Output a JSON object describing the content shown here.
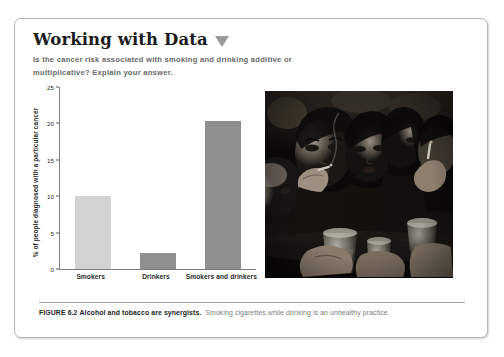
{
  "box": {
    "border_color": "#b6b6b6"
  },
  "header": {
    "title": "Working with Data",
    "triangle_icon": "triangle-down-icon",
    "triangle_color": "#9a9a9a",
    "question": "Is the cancer risk associated with smoking and drinking additive or multiplicative? Explain your answer."
  },
  "chart_data": {
    "type": "bar",
    "title": "",
    "xlabel": "",
    "ylabel": "% of people diagnosed with a particular cancer",
    "categories": [
      "Smokers",
      "Drinkers",
      "Smokers and drinkers"
    ],
    "values": [
      10,
      2.2,
      20.3
    ],
    "bar_colors": [
      "#d2d2d2",
      "#8f8f8f",
      "#8f8f8f"
    ],
    "ylim": [
      0,
      25
    ],
    "yticks": [
      0,
      5,
      10,
      15,
      20,
      25
    ],
    "ytick_labels": [
      "0",
      "5",
      "10",
      "15",
      "20",
      "25"
    ],
    "grid": false,
    "legend": "none"
  },
  "photo": {
    "name": "photo-people-smoking-drinking",
    "description": "Black and white photograph of people at a bar smoking cigarettes and holding drinks"
  },
  "caption": {
    "label": "FIGURE 6.2",
    "bold_text": "Alcohol and tobacco are synergists.",
    "body_text": "Smoking cigarettes while drinking is an unhealthy practice."
  }
}
